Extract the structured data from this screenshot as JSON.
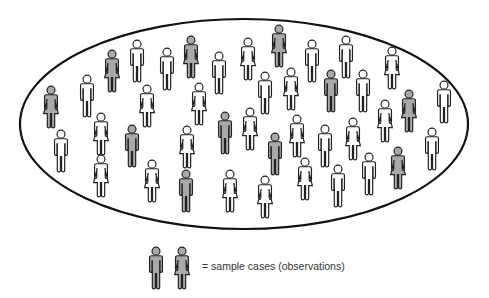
{
  "diagram": {
    "population_boundary": {
      "shape": "ellipse",
      "cx": 244,
      "cy": 124,
      "rx": 224,
      "ry": 105,
      "stroke": "#111111"
    },
    "colors": {
      "sampled_fill": "#a9a9a9",
      "unsampled_fill": "#ffffff",
      "outline": "#222222"
    },
    "figures": [
      {
        "x": 112,
        "y": 50,
        "type": "female",
        "sampled": true
      },
      {
        "x": 137,
        "y": 40,
        "type": "male",
        "sampled": false
      },
      {
        "x": 167,
        "y": 48,
        "type": "male",
        "sampled": false
      },
      {
        "x": 191,
        "y": 36,
        "type": "female",
        "sampled": true
      },
      {
        "x": 219,
        "y": 52,
        "type": "male",
        "sampled": false
      },
      {
        "x": 248,
        "y": 38,
        "type": "female",
        "sampled": false
      },
      {
        "x": 279,
        "y": 25,
        "type": "female",
        "sampled": true
      },
      {
        "x": 312,
        "y": 40,
        "type": "male",
        "sampled": false
      },
      {
        "x": 346,
        "y": 36,
        "type": "male",
        "sampled": false
      },
      {
        "x": 392,
        "y": 47,
        "type": "female",
        "sampled": false
      },
      {
        "x": 51,
        "y": 86,
        "type": "female",
        "sampled": true
      },
      {
        "x": 87,
        "y": 75,
        "type": "male",
        "sampled": false
      },
      {
        "x": 147,
        "y": 85,
        "type": "female",
        "sampled": false
      },
      {
        "x": 199,
        "y": 83,
        "type": "female",
        "sampled": false
      },
      {
        "x": 265,
        "y": 72,
        "type": "male",
        "sampled": false
      },
      {
        "x": 291,
        "y": 68,
        "type": "female",
        "sampled": false
      },
      {
        "x": 331,
        "y": 70,
        "type": "male",
        "sampled": true
      },
      {
        "x": 363,
        "y": 70,
        "type": "male",
        "sampled": false
      },
      {
        "x": 409,
        "y": 90,
        "type": "female",
        "sampled": true
      },
      {
        "x": 444,
        "y": 81,
        "type": "male",
        "sampled": false
      },
      {
        "x": 61,
        "y": 130,
        "type": "male",
        "sampled": false
      },
      {
        "x": 101,
        "y": 113,
        "type": "female",
        "sampled": false
      },
      {
        "x": 132,
        "y": 125,
        "type": "male",
        "sampled": true
      },
      {
        "x": 187,
        "y": 126,
        "type": "female",
        "sampled": false
      },
      {
        "x": 225,
        "y": 112,
        "type": "male",
        "sampled": true
      },
      {
        "x": 250,
        "y": 108,
        "type": "female",
        "sampled": false
      },
      {
        "x": 275,
        "y": 133,
        "type": "male",
        "sampled": true
      },
      {
        "x": 297,
        "y": 115,
        "type": "female",
        "sampled": false
      },
      {
        "x": 325,
        "y": 125,
        "type": "male",
        "sampled": false
      },
      {
        "x": 353,
        "y": 118,
        "type": "female",
        "sampled": false
      },
      {
        "x": 385,
        "y": 100,
        "type": "female",
        "sampled": false
      },
      {
        "x": 398,
        "y": 147,
        "type": "female",
        "sampled": true
      },
      {
        "x": 432,
        "y": 128,
        "type": "male",
        "sampled": false
      },
      {
        "x": 101,
        "y": 155,
        "type": "female",
        "sampled": false
      },
      {
        "x": 152,
        "y": 160,
        "type": "female",
        "sampled": false
      },
      {
        "x": 186,
        "y": 170,
        "type": "male",
        "sampled": true
      },
      {
        "x": 230,
        "y": 170,
        "type": "female",
        "sampled": false
      },
      {
        "x": 265,
        "y": 176,
        "type": "female",
        "sampled": false
      },
      {
        "x": 305,
        "y": 158,
        "type": "female",
        "sampled": false
      },
      {
        "x": 338,
        "y": 165,
        "type": "male",
        "sampled": false
      },
      {
        "x": 369,
        "y": 153,
        "type": "male",
        "sampled": false
      }
    ],
    "legend": {
      "icons": [
        {
          "x": 156,
          "y": 247,
          "type": "male",
          "sampled": true
        },
        {
          "x": 182,
          "y": 247,
          "type": "female",
          "sampled": true
        }
      ],
      "label": "= sample cases (observations)"
    }
  }
}
